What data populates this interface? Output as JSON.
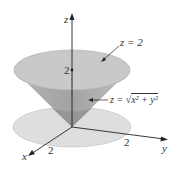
{
  "figure": {
    "axes": {
      "x_label": "x",
      "y_label": "y",
      "z_label": "z"
    },
    "ticks": {
      "z_tick": "2",
      "x_tick": "2",
      "y_tick": "2"
    },
    "annotations": {
      "plane": "z = 2",
      "cone_prefix": "z = ",
      "cone_radicand": "x² + y²"
    },
    "colors": {
      "cone_top": "#c8c8c8",
      "cone_side": "#a8a8a8",
      "cone_shadow": "#8a8a8a",
      "base_disk": "#dcdcdc",
      "axis": "#222222"
    }
  }
}
